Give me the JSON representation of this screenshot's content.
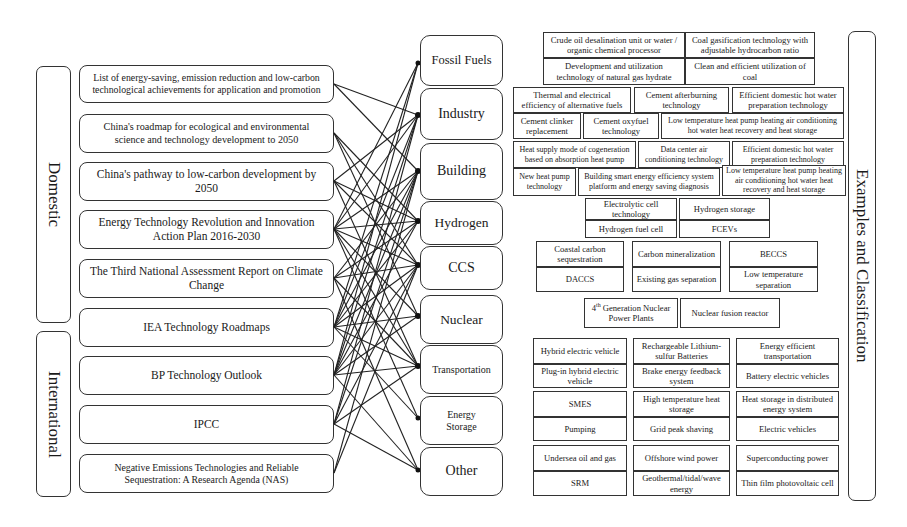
{
  "groups": {
    "domestic": "Domestic",
    "international": "International",
    "examples": "Examples and Classification"
  },
  "sources": [
    {
      "label": "List of energy-saving, emission reduction and low-carbon technological achievements for application and promotion"
    },
    {
      "label": "China's roadmap for ecological and environmental science and technology development to 2050"
    },
    {
      "label": "China's pathway to low-carbon development by 2050"
    },
    {
      "label": "Energy Technology Revolution and Innovation Action Plan 2016-2030"
    },
    {
      "label": "The Third National Assessment Report on Climate Change"
    },
    {
      "label": "IEA Technology Roadmaps"
    },
    {
      "label": "BP Technology Outlook"
    },
    {
      "label": "IPCC"
    },
    {
      "label": "Negative Emissions Technologies and Reliable Sequestration: A Research Agenda (NAS)"
    }
  ],
  "categories": [
    {
      "label": "Fossil Fuels"
    },
    {
      "label": "Industry"
    },
    {
      "label": "Building"
    },
    {
      "label": "Hydrogen"
    },
    {
      "label": "CCS"
    },
    {
      "label": "Nuclear"
    },
    {
      "label": "Transportation"
    },
    {
      "label": "Energy Storage"
    },
    {
      "label": "Other"
    }
  ],
  "examples": {
    "fossil_fuels": [
      "Crude oil desalination unit or water / organic chemical processor",
      "Coal gasification technology with adjustable hydrocarbon ratio",
      "Development and utilization technology of natural gas hydrate",
      "Clean and efficient utilization of coal"
    ],
    "industry": [
      "Thermal and electrical efficiency of alternative fuels",
      "Cement afterburning technology",
      "Efficient domestic hot water preparation technology",
      "Cement clinker replacement",
      "Cement oxyfuel technology",
      "Low temperature heat pump heating air conditioning hot water heat recovery and heat storage"
    ],
    "building": [
      "Heat supply mode of cogeneration based on absorption heat pump",
      "Data center air conditioning technology",
      "Efficient domestic hot water preparation technology",
      "New heat pump technology",
      "Building smart energy efficiency system platform and energy saving diagnosis",
      "Low temperature heat pump heating air conditioning hot water heat recovery and heat storage"
    ],
    "hydrogen": [
      "Electrolytic cell technology",
      "Hydrogen storage",
      "Hydrogen fuel cell",
      "FCEVs"
    ],
    "ccs": [
      "Coastal carbon sequestration",
      "Carbon mineralization",
      "BECCS",
      "DACCS",
      "Existing gas separation",
      "Low temperature separation"
    ],
    "nuclear": [
      "4th Generation Nuclear Power Plants",
      "Nuclear fusion reactor"
    ],
    "transportation": [
      "Hybrid electric vehicle",
      "Rechargeable Lithium-sulfur Batteries",
      "Energy efficient transportation",
      "Plug-in hybrid electric vehicle",
      "Brake energy feedback system",
      "Battery electric vehicles"
    ],
    "energy_storage": [
      "SMES",
      "High temperature heat storage",
      "Heat storage in distributed energy system",
      "Pumping",
      "Grid peak shaving",
      "Electric vehicles"
    ],
    "other": [
      "Undersea oil and gas",
      "Offshore wind power",
      "Superconducting power",
      "SRM",
      "Geothermal/tidal/wave energy",
      "Thin film photovoltaic cell"
    ]
  }
}
